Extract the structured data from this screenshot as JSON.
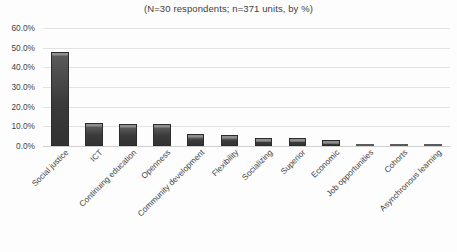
{
  "chart_data": {
    "type": "bar",
    "title": "(N=30 respondents; n=371 units, by %)",
    "xlabel": "",
    "ylabel": "",
    "ylim": [
      0,
      60
    ],
    "grid": true,
    "legend": "none",
    "categories": [
      "Social justice",
      "ICT",
      "Continuing education",
      "Openness",
      "Community development",
      "Flexibility",
      "Socializing",
      "Superior",
      "Economic",
      "Job opportunities",
      "Cohorts",
      "Asynchronous learning"
    ],
    "values": [
      48.0,
      11.5,
      11.0,
      11.0,
      6.0,
      5.5,
      4.0,
      4.0,
      3.0,
      1.0,
      0.5,
      0.2
    ],
    "ytick_labels": [
      "0.0%",
      "10.0%",
      "20.0%",
      "30.0%",
      "40.0%",
      "50.0%",
      "60.0%"
    ],
    "ytick_values": [
      0,
      10,
      20,
      30,
      40,
      50,
      60
    ],
    "series_color": "#3a3a3a",
    "gridline_color": "#e2e2e2",
    "background_color": "#fdfdfd"
  }
}
